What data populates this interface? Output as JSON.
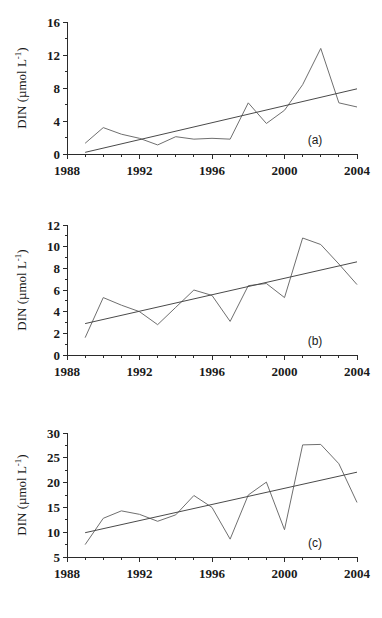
{
  "figure": {
    "title": "",
    "panel_count": 3
  },
  "chart_data": [
    {
      "id": "a",
      "type": "line",
      "title": "",
      "panel_label": "(a)",
      "xlabel": "",
      "ylabel": "DIN (µmol L⁻¹)",
      "ylabel_main": "DIN (µmol L",
      "ylabel_sup": "-1",
      "ylabel_close": ")",
      "xlim": [
        1988,
        2004
      ],
      "ylim": [
        0,
        16
      ],
      "yticks": [
        0,
        4,
        8,
        12,
        16
      ],
      "ytick_labels": [
        "0",
        "4",
        "8",
        "12",
        "16"
      ],
      "xticks": [
        1988,
        1992,
        1996,
        2000,
        2004
      ],
      "xtick_labels": [
        "1988",
        "1992",
        "1996",
        "2000",
        "2004"
      ],
      "xminor_step": 1,
      "grid": false,
      "legend": "none",
      "series": [
        {
          "name": "DIN observed",
          "kind": "data",
          "x": [
            1989,
            1990,
            1991,
            1992,
            1993,
            1994,
            1995,
            1996,
            1997,
            1998,
            1999,
            2000,
            2001,
            2002,
            2003,
            2004
          ],
          "values": [
            1.3,
            3.2,
            2.4,
            1.9,
            1.1,
            2.1,
            1.8,
            1.9,
            1.8,
            6.2,
            3.7,
            5.3,
            8.4,
            12.8,
            6.2,
            5.7
          ]
        },
        {
          "name": "Linear trend",
          "kind": "trend",
          "x": [
            1989,
            2004
          ],
          "values": [
            0.2,
            7.9
          ]
        }
      ]
    },
    {
      "id": "b",
      "type": "line",
      "title": "",
      "panel_label": "(b)",
      "xlabel": "",
      "ylabel": "DIN (µmol L⁻¹)",
      "ylabel_main": "DIN (µmol L",
      "ylabel_sup": "-1",
      "ylabel_close": ")",
      "xlim": [
        1988,
        2004
      ],
      "ylim": [
        0,
        12
      ],
      "yticks": [
        0,
        2,
        4,
        6,
        8,
        10,
        12
      ],
      "ytick_labels": [
        "0",
        "2",
        "4",
        "6",
        "8",
        "10",
        "12"
      ],
      "xticks": [
        1988,
        1992,
        1996,
        2000,
        2004
      ],
      "xtick_labels": [
        "1988",
        "1992",
        "1996",
        "2000",
        "2004"
      ],
      "xminor_step": 1,
      "grid": false,
      "legend": "none",
      "series": [
        {
          "name": "DIN observed",
          "kind": "data",
          "x": [
            1989,
            1990,
            1991,
            1992,
            1993,
            1994,
            1995,
            1996,
            1997,
            1998,
            1999,
            2000,
            2001,
            2002,
            2003,
            2004
          ],
          "values": [
            1.6,
            5.3,
            4.6,
            4.0,
            2.8,
            4.4,
            6.0,
            5.5,
            3.1,
            6.4,
            6.6,
            5.3,
            10.8,
            10.2,
            8.4,
            6.5
          ]
        },
        {
          "name": "Linear trend",
          "kind": "trend",
          "x": [
            1989,
            2004
          ],
          "values": [
            2.9,
            8.6
          ]
        }
      ]
    },
    {
      "id": "c",
      "type": "line",
      "title": "",
      "panel_label": "(c)",
      "xlabel": "",
      "ylabel": "DIN (µmol L⁻¹)",
      "ylabel_main": "DIN (µmol L",
      "ylabel_sup": "-1",
      "ylabel_close": ")",
      "xlim": [
        1988,
        2004
      ],
      "ylim": [
        5,
        30
      ],
      "yticks": [
        5,
        10,
        15,
        20,
        25,
        30
      ],
      "ytick_labels": [
        "5",
        "10",
        "15",
        "20",
        "25",
        "30"
      ],
      "xticks": [
        1988,
        1992,
        1996,
        2000,
        2004
      ],
      "xtick_labels": [
        "1988",
        "1992",
        "1996",
        "2000",
        "2004"
      ],
      "xminor_step": 1,
      "grid": false,
      "legend": "none",
      "series": [
        {
          "name": "DIN observed",
          "kind": "data",
          "x": [
            1989,
            1990,
            1991,
            1992,
            1993,
            1994,
            1995,
            1996,
            1997,
            1998,
            1999,
            2000,
            2001,
            2002,
            2003,
            2004
          ],
          "values": [
            7.5,
            12.8,
            14.3,
            13.6,
            12.2,
            13.5,
            17.4,
            15.0,
            8.6,
            17.5,
            20.1,
            10.5,
            27.6,
            27.7,
            23.8,
            16.0
          ]
        },
        {
          "name": "Linear trend",
          "kind": "trend",
          "x": [
            1989,
            2004
          ],
          "values": [
            9.9,
            22.1
          ]
        }
      ]
    }
  ]
}
